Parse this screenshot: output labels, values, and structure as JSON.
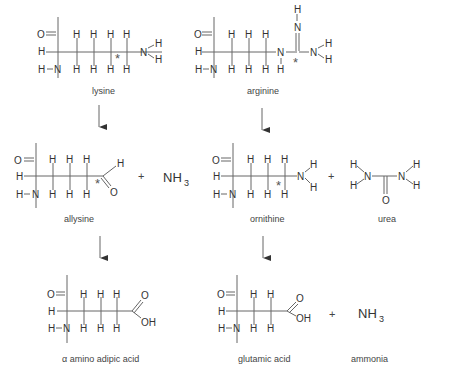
{
  "atoms": {
    "O": "O",
    "H": "H",
    "N": "N",
    "OH": "OH",
    "star": "*",
    "NH": "NH",
    "sub3": "3"
  },
  "plus": "+",
  "compounds": {
    "lysine": {
      "label": "lysine"
    },
    "arginine": {
      "label": "arginine"
    },
    "allysine": {
      "label": "allysine"
    },
    "ornithine": {
      "label": "ornithine"
    },
    "urea": {
      "label": "urea"
    },
    "ammonia_top": {
      "label": "NH",
      "subscript": "3"
    },
    "aaa": {
      "label": "α amino adipic acid"
    },
    "glutamic": {
      "label": "glutamic acid"
    },
    "ammonia": {
      "label": "ammonia",
      "formula": "NH",
      "subscript": "3"
    }
  },
  "arrows": [
    {
      "from": "lysine",
      "to": "allysine"
    },
    {
      "from": "arginine",
      "to": "ornithine"
    },
    {
      "from": "allysine",
      "to": "α amino adipic acid"
    },
    {
      "from": "ornithine",
      "to": "glutamic acid"
    }
  ]
}
